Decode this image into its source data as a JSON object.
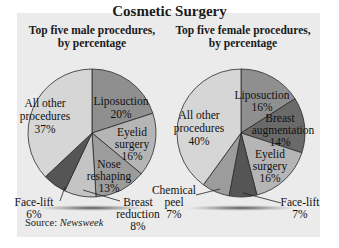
{
  "chart_data": [
    {
      "type": "pie",
      "title": "Cosmetic Surgery",
      "subtitle": "Top five male procedures, by percentage",
      "categories": [
        "Liposuction",
        "Eyelid surgery",
        "Nose reshaping",
        "Breast reduction",
        "Face-lift",
        "All other procedures"
      ],
      "values": [
        20,
        16,
        13,
        8,
        6,
        37
      ],
      "unit": "%",
      "colors": [
        "#8f8f8f",
        "#b5b5b5",
        "#9c9c9c",
        "#c4c4c4",
        "#555555",
        "#d6d6d6"
      ],
      "start_angle": "top, clockwise"
    },
    {
      "type": "pie",
      "title": "Cosmetic Surgery",
      "subtitle": "Top five female procedures, by percentage",
      "categories": [
        "Liposuction",
        "Breast augmentation",
        "Eyelid surgery",
        "Face-lift",
        "Chemical peel",
        "All other procedures"
      ],
      "values": [
        16,
        14,
        16,
        7,
        7,
        40
      ],
      "unit": "%",
      "colors": [
        "#8f8f8f",
        "#6a6a6a",
        "#b5b5b5",
        "#555555",
        "#9c9c9c",
        "#d6d6d6"
      ],
      "start_angle": "top, clockwise"
    }
  ],
  "header": {
    "title": "Cosmetic Surgery",
    "left_subtitle_line1": "Top five male procedures,",
    "left_subtitle_line2": "by percentage",
    "right_subtitle_line1": "Top five female procedures,",
    "right_subtitle_line2": "by percentage"
  },
  "male_labels": {
    "lipo_1": "Liposuction",
    "lipo_2": "20%",
    "eyelid_1": "Eyelid",
    "eyelid_2": "surgery",
    "eyelid_3": "16%",
    "nose_1": "Nose",
    "nose_2": "reshaping",
    "nose_3": "13%",
    "breast_1": "Breast",
    "breast_2": "reduction",
    "breast_3": "8%",
    "face_1": "Face-lift",
    "face_2": "6%",
    "other_1": "All other",
    "other_2": "procedures",
    "other_3": "37%"
  },
  "female_labels": {
    "lipo_1": "Liposuction",
    "lipo_2": "16%",
    "breast_1": "Breast",
    "breast_2": "augmentation",
    "breast_3": "14%",
    "eyelid_1": "Eyelid",
    "eyelid_2": "surgery",
    "eyelid_3": "16%",
    "face_1": "Face-lift",
    "face_2": "7%",
    "peel_1": "Chemical",
    "peel_2": "peel",
    "peel_3": "7%",
    "other_1": "All other",
    "other_2": "procedures",
    "other_3": "40%"
  },
  "footer": {
    "source_label": "Source: ",
    "source_name": "Newsweek"
  }
}
